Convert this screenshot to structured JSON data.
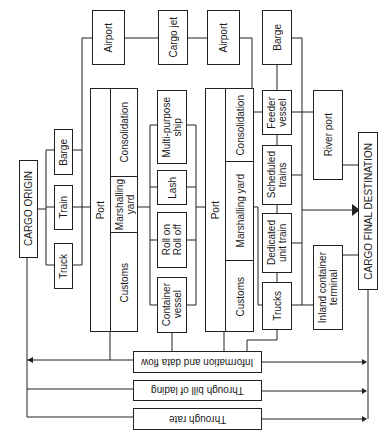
{
  "diagram": {
    "orientation": "rotated 90° counter-clockwise",
    "origin": "CARGO ORIGIN",
    "destination": "CARGO FINAL DESTINATION",
    "origin_modes": [
      "Truck",
      "Train",
      "Barge"
    ],
    "port1": {
      "title": "Port",
      "sections": [
        "Customs",
        "Marshalling\nyard",
        "Consolidation"
      ]
    },
    "airport1": "Airport",
    "cargo_jet": "Cargo jet",
    "ships": [
      "Container\nvessel",
      "Roll on\nRoll off",
      "Lash",
      "Multi-purpose\nship"
    ],
    "port2": {
      "title": "Port",
      "sections": [
        "Customs",
        "Marshalling yard",
        "Consolidation"
      ]
    },
    "airport2": "Airport",
    "onward": [
      "Trucks",
      "Dedicated\nunit train",
      "Scheduled\ntrains",
      "Feeder\nvessel",
      "Barge"
    ],
    "river_port": "River port",
    "inland_terminal": "Inland container\nterminal",
    "flows": [
      "Information and data flow",
      "Through bill of lading",
      "Through rate"
    ]
  }
}
